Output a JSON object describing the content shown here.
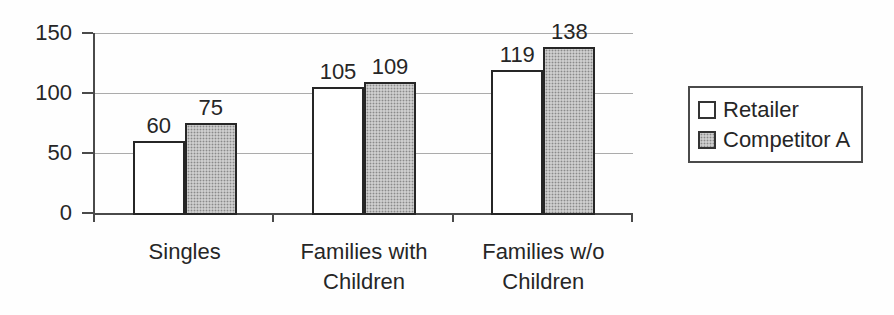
{
  "chart_data": {
    "type": "bar",
    "title": "",
    "categories": [
      "Singles",
      "Families with Children",
      "Families w/o Children"
    ],
    "series": [
      {
        "name": "Retailer",
        "values": [
          60,
          105,
          119
        ],
        "fill": "white"
      },
      {
        "name": "Competitor A",
        "values": [
          75,
          109,
          138
        ],
        "fill": "halftone-gray"
      }
    ],
    "y_ticks": [
      0,
      50,
      100,
      150
    ],
    "ylim": [
      0,
      150
    ],
    "grid": true,
    "data_labels": true,
    "legend_position": "right"
  },
  "colors": {
    "background": "#fefefe",
    "axis": "#4a4a4a",
    "gridline": "#ababab",
    "bar_border": "#262626",
    "halftone_base": "#cdcdcd",
    "halftone_dot": "#8a8a8a",
    "text": "#262626"
  }
}
